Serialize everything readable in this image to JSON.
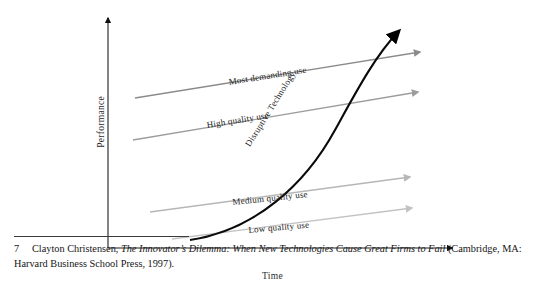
{
  "figure": {
    "axes": {
      "y_label": "Performance",
      "x_label": "Time"
    },
    "curves": [
      {
        "id": "most-demanding",
        "label": "Most demanding use",
        "color": "#8b8b8b"
      },
      {
        "id": "high-quality",
        "label": "High quality use",
        "color": "#9c9c9c"
      },
      {
        "id": "disruptive",
        "label": "Disruptive Technology",
        "color": "#111111"
      },
      {
        "id": "medium-quality",
        "label": "Medium quality use",
        "color": "#b6b6b6"
      },
      {
        "id": "low-quality",
        "label": "Low quality use",
        "color": "#c2c2c2"
      }
    ]
  },
  "footnote": {
    "marker": "7",
    "author": "Clayton Christensen,",
    "title": "The Innovator’s Dilemma: When New Technologies Cause Great Firms to Fail",
    "publication": "(Cambridge, MA: Harvard Business School Press, 1997)."
  }
}
